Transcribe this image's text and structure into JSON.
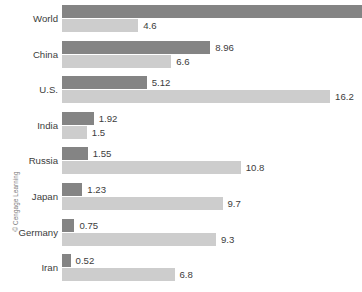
{
  "credit": "© Cengage Learning",
  "chart_data": {
    "type": "bar",
    "orientation": "horizontal",
    "title": "",
    "subtitle": "",
    "xlabel": "",
    "ylabel": "",
    "grid": false,
    "legend_position": "none",
    "xlim": [
      0,
      18.2
    ],
    "px_per_unit": 16.55,
    "categories": [
      "World",
      "China",
      "U.S.",
      "India",
      "Russia",
      "Japan",
      "Germany",
      "Iran"
    ],
    "series": [
      {
        "name": "dark",
        "color": "#848484",
        "values": [
          18.2,
          8.96,
          5.12,
          1.92,
          1.55,
          1.23,
          0.75,
          0.52
        ],
        "labels": [
          "",
          "8.96",
          "5.12",
          "1.92",
          "1.55",
          "1.23",
          "0.75",
          "0.52"
        ],
        "clipped": [
          true,
          false,
          false,
          false,
          false,
          false,
          false,
          false
        ]
      },
      {
        "name": "light",
        "color": "#cdcdcd",
        "values": [
          4.6,
          6.6,
          16.2,
          1.5,
          10.8,
          9.7,
          9.3,
          6.8
        ],
        "labels": [
          "4.6",
          "6.6",
          "16.2",
          "1.5",
          "10.8",
          "9.7",
          "9.3",
          "6.8"
        ],
        "clipped": [
          false,
          false,
          false,
          false,
          false,
          false,
          false,
          false
        ]
      }
    ]
  }
}
